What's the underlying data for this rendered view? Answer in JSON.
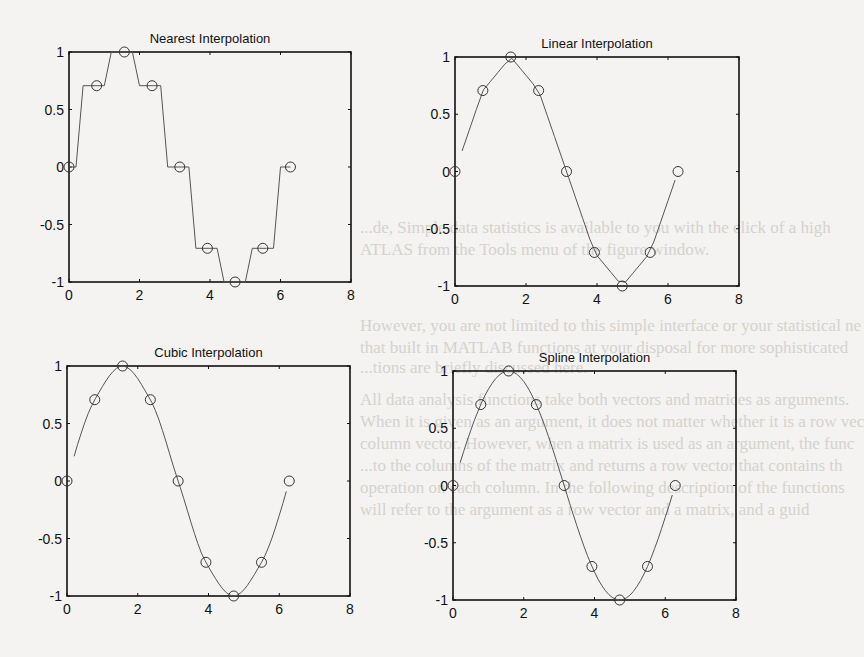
{
  "page": {
    "bleed_through_lines": [
      {
        "text": "...de, Simple data statistics is available to you with the click of a high",
        "x": 360,
        "y": 218
      },
      {
        "text": "ATLAS from the Tools menu of the figure window.",
        "x": 360,
        "y": 240
      },
      {
        "text": "However, you are not limited to this simple interface or your statistical ne",
        "x": 360,
        "y": 316
      },
      {
        "text": "that built in MATLAB functions at your disposal for more sophisticated",
        "x": 360,
        "y": 338
      },
      {
        "text": "...tions are briefly discussed here.",
        "x": 360,
        "y": 358
      },
      {
        "text": "All data analysis functions take both vectors and matrices as arguments.",
        "x": 360,
        "y": 390
      },
      {
        "text": "When it is given as an argument, it does not matter whether it is a row vec",
        "x": 360,
        "y": 412
      },
      {
        "text": "column vector. However, when a matrix is used as an argument, the func",
        "x": 360,
        "y": 434
      },
      {
        "text": "...to the columns of the matrix and returns a row vector that contains th",
        "x": 360,
        "y": 456
      },
      {
        "text": "operation on each column. In the following description of the functions",
        "x": 360,
        "y": 478
      },
      {
        "text": "will refer to the argument as a row vector and a matrix, and a guid",
        "x": 360,
        "y": 500
      }
    ]
  },
  "chart_data": [
    {
      "type": "line",
      "title": "Nearest Interpolation",
      "method": "nearest",
      "box": {
        "left": 69,
        "top": 52,
        "right": 351,
        "bottom": 282
      },
      "xlim": [
        0,
        8
      ],
      "ylim": [
        -1,
        1
      ],
      "xticks": [
        0,
        2,
        4,
        6,
        8
      ],
      "yticks": [
        1,
        0.5,
        0,
        -0.5,
        -1
      ],
      "xtick_labels": [
        "0",
        "2",
        "4",
        "6",
        "8"
      ],
      "ytick_labels": [
        "1",
        "0.5",
        "0",
        "-0.5",
        "-1"
      ],
      "grid": false,
      "markers": {
        "x": [
          0,
          0.785,
          1.571,
          2.356,
          3.142,
          3.927,
          4.712,
          5.498,
          6.283
        ],
        "y": [
          0,
          0.707,
          1,
          0.707,
          0,
          -0.707,
          -1,
          -0.707,
          0
        ],
        "style": "open-circle"
      },
      "curve": {
        "x_start": 0,
        "x_end": 6.283,
        "step": 0.2
      }
    },
    {
      "type": "line",
      "title": "Linear Interpolation",
      "method": "linear",
      "box": {
        "left": 455,
        "top": 57,
        "right": 739,
        "bottom": 286
      },
      "xlim": [
        0,
        8
      ],
      "ylim": [
        -1,
        1
      ],
      "xticks": [
        0,
        2,
        4,
        6,
        8
      ],
      "yticks": [
        1,
        0.5,
        0,
        -0.5,
        -1
      ],
      "xtick_labels": [
        "0",
        "2",
        "4",
        "6",
        "8"
      ],
      "ytick_labels": [
        "1",
        "0.5",
        "0",
        "-0.5",
        "-1"
      ],
      "grid": false,
      "markers": {
        "x": [
          0,
          0.785,
          1.571,
          2.356,
          3.142,
          3.927,
          4.712,
          5.498,
          6.283
        ],
        "y": [
          0,
          0.707,
          1,
          0.707,
          0,
          -0.707,
          -1,
          -0.707,
          0
        ],
        "style": "open-circle"
      },
      "curve": {
        "x_start": 0.2,
        "x_end": 6.283,
        "step": 0.2
      }
    },
    {
      "type": "line",
      "title": "Cubic Interpolation",
      "method": "cubic",
      "box": {
        "left": 67,
        "top": 366,
        "right": 350,
        "bottom": 596
      },
      "xlim": [
        0,
        8
      ],
      "ylim": [
        -1,
        1
      ],
      "xticks": [
        0,
        2,
        4,
        6,
        8
      ],
      "yticks": [
        1,
        0.5,
        0,
        -0.5,
        -1
      ],
      "xtick_labels": [
        "0",
        "2",
        "4",
        "6",
        "8"
      ],
      "ytick_labels": [
        "1",
        "0.5",
        "0",
        "-0.5",
        "-1"
      ],
      "grid": false,
      "markers": {
        "x": [
          0,
          0.785,
          1.571,
          2.356,
          3.142,
          3.927,
          4.712,
          5.498,
          6.283
        ],
        "y": [
          0,
          0.707,
          1,
          0.707,
          0,
          -0.707,
          -1,
          -0.707,
          0
        ],
        "style": "open-circle"
      },
      "curve": {
        "x_start": 0.2,
        "x_end": 6.283,
        "step": 0.1
      }
    },
    {
      "type": "line",
      "title": "Spline Interpolation",
      "method": "spline",
      "box": {
        "left": 453,
        "top": 371,
        "right": 736,
        "bottom": 600
      },
      "xlim": [
        0,
        8
      ],
      "ylim": [
        -1,
        1
      ],
      "xticks": [
        0,
        2,
        4,
        6,
        8
      ],
      "yticks": [
        1,
        0.5,
        0,
        -0.5,
        -1
      ],
      "xtick_labels": [
        "0",
        "2",
        "4",
        "6",
        "8"
      ],
      "ytick_labels": [
        "1",
        "0.5",
        "0",
        "-0.5",
        "-1"
      ],
      "grid": false,
      "markers": {
        "x": [
          0,
          0.785,
          1.571,
          2.356,
          3.142,
          3.927,
          4.712,
          5.498,
          6.283
        ],
        "y": [
          0,
          0.707,
          1,
          0.707,
          0,
          -0.707,
          -1,
          -0.707,
          0
        ],
        "style": "open-circle"
      },
      "curve": {
        "x_start": 0.2,
        "x_end": 6.283,
        "step": 0.1
      }
    }
  ]
}
